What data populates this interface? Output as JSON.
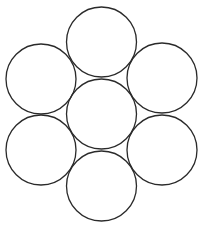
{
  "diagram": {
    "title": "",
    "stroke_color": "#2a2a2a",
    "fill_color": "#ffffff",
    "stroke_width": 1.3,
    "radius": 35,
    "circles": [
      {
        "name": "top",
        "cx": 101.5,
        "cy": 42
      },
      {
        "name": "upper-left",
        "cx": 41,
        "cy": 79
      },
      {
        "name": "upper-right",
        "cx": 162,
        "cy": 78
      },
      {
        "name": "center",
        "cx": 101.5,
        "cy": 114
      },
      {
        "name": "lower-left",
        "cx": 41,
        "cy": 150
      },
      {
        "name": "lower-right",
        "cx": 162,
        "cy": 150
      },
      {
        "name": "bottom",
        "cx": 101.5,
        "cy": 186
      }
    ]
  }
}
